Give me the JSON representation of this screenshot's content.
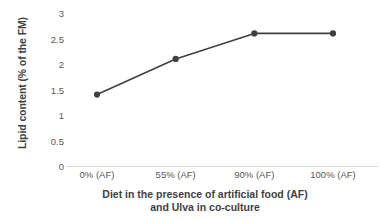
{
  "chart_data": {
    "type": "line",
    "title": "",
    "xlabel": "Diet in the presence of artificial food (AF) and Ulva in co-culture",
    "xlabel_line1": "Diet in the presence of artificial food (AF)",
    "xlabel_line2": "and Ulva in co-culture",
    "ylabel": "Lipid content (% of the FM)",
    "categories": [
      "0% (AF)",
      "55% (AF)",
      "90% (AF)",
      "100% (AF)"
    ],
    "values": [
      1.4,
      2.1,
      2.6,
      2.6
    ],
    "series": [
      {
        "name": "Lipid content",
        "values": [
          1.4,
          2.1,
          2.6,
          2.6
        ]
      }
    ],
    "ylim": [
      0,
      3
    ],
    "yticks": [
      "0",
      "0.5",
      "1",
      "1.5",
      "2",
      "2.5",
      "3"
    ],
    "ytick_values": [
      0,
      0.5,
      1,
      1.5,
      2,
      2.5,
      3
    ],
    "grid": false,
    "legend": false,
    "legend_position": "none",
    "marker": "circle",
    "line_color": "#404040",
    "marker_color": "#404040",
    "axis_color": "#d9d9d9",
    "background": "#ffffff"
  }
}
